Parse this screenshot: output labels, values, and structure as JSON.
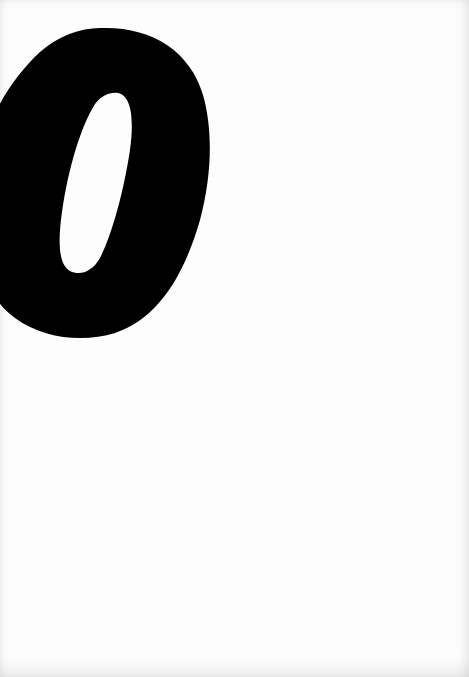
{
  "page": {
    "background_color": "#fdfdfd",
    "content": {
      "glyph": {
        "character": "0",
        "style": "bold italic",
        "color": "#000000",
        "counter_color": "#fdfdfd"
      }
    }
  }
}
